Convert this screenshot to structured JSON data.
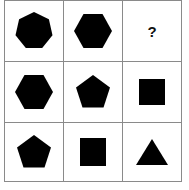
{
  "puzzle": {
    "type": "3x3 shape matrix",
    "colors": {
      "shape_fill": "#000000",
      "grid_line": "#8a8a8a",
      "background": "#ffffff"
    },
    "cells": [
      {
        "row": 1,
        "col": 1,
        "shape": "heptagon"
      },
      {
        "row": 1,
        "col": 2,
        "shape": "hexagon"
      },
      {
        "row": 1,
        "col": 3,
        "shape": "unknown",
        "label": "?"
      },
      {
        "row": 2,
        "col": 1,
        "shape": "hexagon"
      },
      {
        "row": 2,
        "col": 2,
        "shape": "pentagon"
      },
      {
        "row": 2,
        "col": 3,
        "shape": "square"
      },
      {
        "row": 3,
        "col": 1,
        "shape": "pentagon"
      },
      {
        "row": 3,
        "col": 2,
        "shape": "square"
      },
      {
        "row": 3,
        "col": 3,
        "shape": "triangle"
      }
    ],
    "question_mark": "?"
  }
}
